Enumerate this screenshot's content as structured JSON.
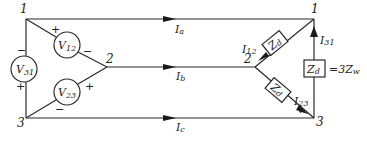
{
  "diagram": {
    "title": "",
    "nodes": {
      "left_1": "1",
      "left_2": "2",
      "left_3": "3",
      "right_1": "1",
      "right_2": "2",
      "right_3": "3"
    },
    "sources": [
      {
        "id": "V31",
        "label_main": "V",
        "label_sub": "31",
        "plus": "+",
        "minus": "−"
      },
      {
        "id": "V12",
        "label_main": "V",
        "label_sub": "12",
        "plus": "+",
        "minus": "−"
      },
      {
        "id": "V23",
        "label_main": "V",
        "label_sub": "23",
        "plus": "+",
        "minus": "−"
      }
    ],
    "line_currents": [
      {
        "id": "Ia",
        "main": "I",
        "sub": "a"
      },
      {
        "id": "Ib",
        "main": "I",
        "sub": "b"
      },
      {
        "id": "Ic",
        "main": "I",
        "sub": "c"
      }
    ],
    "branch_currents": [
      {
        "id": "I12",
        "main": "I",
        "sub": "12"
      },
      {
        "id": "I23",
        "main": "I",
        "sub": "23"
      },
      {
        "id": "I31",
        "main": "I",
        "sub": "31"
      }
    ],
    "impedances": [
      {
        "id": "Zd_12",
        "main": "Z",
        "sub": "d"
      },
      {
        "id": "Zd_23",
        "main": "Z",
        "sub": "d"
      },
      {
        "id": "Zd_31",
        "main": "Z",
        "sub": "d"
      }
    ],
    "impedance_equation": {
      "prefix": "=3Z",
      "sub": "w"
    }
  }
}
